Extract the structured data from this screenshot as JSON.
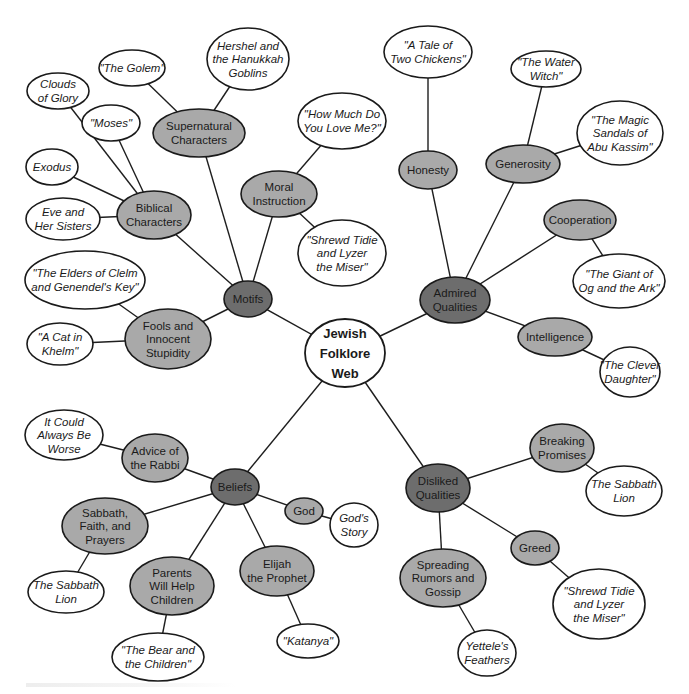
{
  "colors": {
    "background": "#ffffff",
    "root_fill": "#ffffff",
    "category_fill": "#6d6d6d",
    "subtopic_fill": "#a9a9a9",
    "story_fill": "#ffffff",
    "stroke": "#1a1a1a"
  },
  "nodes": [
    {
      "id": "root",
      "type": "root",
      "lines": [
        "Jewish",
        "Folklore",
        "Web"
      ],
      "cx": 345,
      "cy": 353,
      "rx": 40,
      "ry": 34
    },
    {
      "id": "motifs",
      "type": "cat",
      "lines": [
        "Motifs"
      ],
      "cx": 248,
      "cy": 299,
      "rx": 24,
      "ry": 18
    },
    {
      "id": "admired",
      "type": "cat",
      "lines": [
        "Admired",
        "Qualities"
      ],
      "cx": 455,
      "cy": 300,
      "rx": 35,
      "ry": 23
    },
    {
      "id": "beliefs",
      "type": "cat",
      "lines": [
        "Beliefs"
      ],
      "cx": 235,
      "cy": 487,
      "rx": 24,
      "ry": 18
    },
    {
      "id": "disliked",
      "type": "cat",
      "lines": [
        "Disliked",
        "Qualities"
      ],
      "cx": 438,
      "cy": 488,
      "rx": 32,
      "ry": 24
    },
    {
      "id": "supernatural",
      "type": "sub",
      "lines": [
        "Supernatural",
        "Characters"
      ],
      "cx": 199,
      "cy": 133,
      "rx": 46,
      "ry": 24
    },
    {
      "id": "hershel",
      "type": "leaf",
      "lines": [
        "Hershel and",
        "the Hanukkah",
        "Goblins"
      ],
      "cx": 248,
      "cy": 59,
      "rx": 41,
      "ry": 31
    },
    {
      "id": "golem",
      "type": "leaf",
      "lines": [
        "\"The Golem\""
      ],
      "cx": 132,
      "cy": 68,
      "rx": 33,
      "ry": 18
    },
    {
      "id": "biblical",
      "type": "sub",
      "lines": [
        "Biblical",
        "Characters"
      ],
      "cx": 154,
      "cy": 215,
      "rx": 37,
      "ry": 24
    },
    {
      "id": "clouds",
      "type": "leaf",
      "lines": [
        "Clouds",
        "of Glory"
      ],
      "cx": 58,
      "cy": 91,
      "rx": 31,
      "ry": 18
    },
    {
      "id": "moses",
      "type": "leaf",
      "lines": [
        "\"Moses\""
      ],
      "cx": 111,
      "cy": 123,
      "rx": 29,
      "ry": 18
    },
    {
      "id": "exodus",
      "type": "leaf",
      "lines": [
        "Exodus"
      ],
      "cx": 52,
      "cy": 167,
      "rx": 26,
      "ry": 18
    },
    {
      "id": "eve",
      "type": "leaf",
      "lines": [
        "Eve and",
        "Her Sisters"
      ],
      "cx": 63,
      "cy": 219,
      "rx": 37,
      "ry": 21
    },
    {
      "id": "moral",
      "type": "sub",
      "lines": [
        "Moral",
        "Instruction"
      ],
      "cx": 279,
      "cy": 194,
      "rx": 38,
      "ry": 23
    },
    {
      "id": "howmuch",
      "type": "leaf",
      "lines": [
        "\"How Much Do",
        "You Love Me?\""
      ],
      "cx": 342,
      "cy": 121,
      "rx": 44,
      "ry": 28
    },
    {
      "id": "shrewd1",
      "type": "leaf",
      "lines": [
        "\"Shrewd Tidie",
        "and Lyzer",
        "the Miser\""
      ],
      "cx": 342,
      "cy": 253,
      "rx": 44,
      "ry": 33
    },
    {
      "id": "fools",
      "type": "sub",
      "lines": [
        "Fools and",
        "Innocent",
        "Stupidity"
      ],
      "cx": 168,
      "cy": 339,
      "rx": 43,
      "ry": 30
    },
    {
      "id": "elders",
      "type": "leaf",
      "lines": [
        "\"The Elders of Clelm",
        "and Genendel's Key\""
      ],
      "cx": 85,
      "cy": 280,
      "rx": 60,
      "ry": 29
    },
    {
      "id": "cat",
      "type": "leaf",
      "lines": [
        "\"A Cat in",
        "Khelm\""
      ],
      "cx": 60,
      "cy": 344,
      "rx": 33,
      "ry": 21
    },
    {
      "id": "honesty",
      "type": "sub",
      "lines": [
        "Honesty"
      ],
      "cx": 428,
      "cy": 170,
      "rx": 29,
      "ry": 19
    },
    {
      "id": "chickens",
      "type": "leaf",
      "lines": [
        "\"A Tale of",
        "Two Chickens\""
      ],
      "cx": 428,
      "cy": 52,
      "rx": 44,
      "ry": 26
    },
    {
      "id": "generosity",
      "type": "sub",
      "lines": [
        "Generosity"
      ],
      "cx": 523,
      "cy": 164,
      "rx": 37,
      "ry": 19
    },
    {
      "id": "waterwitch",
      "type": "leaf",
      "lines": [
        "\"The Water",
        "Witch\""
      ],
      "cx": 546,
      "cy": 69,
      "rx": 35,
      "ry": 18
    },
    {
      "id": "sandals",
      "type": "leaf",
      "lines": [
        "\"The Magic",
        "Sandals of",
        "Abu Kassim\""
      ],
      "cx": 620,
      "cy": 133,
      "rx": 43,
      "ry": 32
    },
    {
      "id": "cooperation",
      "type": "sub",
      "lines": [
        "Cooperation"
      ],
      "cx": 580,
      "cy": 220,
      "rx": 36,
      "ry": 20
    },
    {
      "id": "giant",
      "type": "leaf",
      "lines": [
        "\"The Giant of",
        "Og and the Ark\""
      ],
      "cx": 619,
      "cy": 281,
      "rx": 46,
      "ry": 27
    },
    {
      "id": "intelligence",
      "type": "sub",
      "lines": [
        "Intelligence"
      ],
      "cx": 555,
      "cy": 337,
      "rx": 37,
      "ry": 19
    },
    {
      "id": "clever",
      "type": "leaf",
      "lines": [
        "\"The Clever",
        "Daughter\""
      ],
      "cx": 630,
      "cy": 372,
      "rx": 30,
      "ry": 25
    },
    {
      "id": "rabbi",
      "type": "sub",
      "lines": [
        "Advice of",
        "the Rabbi"
      ],
      "cx": 155,
      "cy": 458,
      "rx": 33,
      "ry": 24
    },
    {
      "id": "worse",
      "type": "leaf",
      "lines": [
        "It Could",
        "Always Be",
        "Worse"
      ],
      "cx": 64,
      "cy": 435,
      "rx": 39,
      "ry": 25
    },
    {
      "id": "god",
      "type": "sub",
      "lines": [
        "God"
      ],
      "cx": 304,
      "cy": 511,
      "rx": 19,
      "ry": 13
    },
    {
      "id": "godstory",
      "type": "leaf",
      "lines": [
        "God's",
        "Story"
      ],
      "cx": 354,
      "cy": 525,
      "rx": 24,
      "ry": 22
    },
    {
      "id": "sabbath",
      "type": "sub",
      "lines": [
        "Sabbath,",
        "Faith, and",
        "Prayers"
      ],
      "cx": 105,
      "cy": 526,
      "rx": 43,
      "ry": 28
    },
    {
      "id": "lion1",
      "type": "leaf",
      "lines": [
        "The Sabbath",
        "Lion"
      ],
      "cx": 66,
      "cy": 592,
      "rx": 38,
      "ry": 21
    },
    {
      "id": "parents",
      "type": "sub",
      "lines": [
        "Parents",
        "Will Help",
        "Children"
      ],
      "cx": 172,
      "cy": 586,
      "rx": 42,
      "ry": 29
    },
    {
      "id": "bear",
      "type": "leaf",
      "lines": [
        "\"The Bear and",
        "the Children\""
      ],
      "cx": 158,
      "cy": 657,
      "rx": 46,
      "ry": 24
    },
    {
      "id": "elijah",
      "type": "sub",
      "lines": [
        "Elijah",
        "the Prophet"
      ],
      "cx": 277,
      "cy": 571,
      "rx": 37,
      "ry": 25
    },
    {
      "id": "katanya",
      "type": "leaf",
      "lines": [
        "\"Katanya\""
      ],
      "cx": 308,
      "cy": 641,
      "rx": 31,
      "ry": 17
    },
    {
      "id": "promises",
      "type": "sub",
      "lines": [
        "Breaking",
        "Promises"
      ],
      "cx": 562,
      "cy": 448,
      "rx": 32,
      "ry": 24
    },
    {
      "id": "lion2",
      "type": "leaf",
      "lines": [
        "The Sabbath",
        "Lion"
      ],
      "cx": 624,
      "cy": 491,
      "rx": 38,
      "ry": 25
    },
    {
      "id": "greed",
      "type": "sub",
      "lines": [
        "Greed"
      ],
      "cx": 535,
      "cy": 548,
      "rx": 24,
      "ry": 17
    },
    {
      "id": "shrewd2",
      "type": "leaf",
      "lines": [
        "\"Shrewd Tidie",
        "and Lyzer",
        "the Miser\""
      ],
      "cx": 599,
      "cy": 604,
      "rx": 46,
      "ry": 35
    },
    {
      "id": "rumors",
      "type": "sub",
      "lines": [
        "Spreading",
        "Rumors and",
        "Gossip"
      ],
      "cx": 443,
      "cy": 578,
      "rx": 43,
      "ry": 29
    },
    {
      "id": "yettele",
      "type": "leaf",
      "lines": [
        "Yettele's",
        "Feathers"
      ],
      "cx": 487,
      "cy": 653,
      "rx": 29,
      "ry": 23
    }
  ],
  "edges": [
    [
      "root",
      "motifs"
    ],
    [
      "root",
      "admired"
    ],
    [
      "root",
      "beliefs"
    ],
    [
      "root",
      "disliked"
    ],
    [
      "motifs",
      "supernatural"
    ],
    [
      "motifs",
      "biblical"
    ],
    [
      "motifs",
      "moral"
    ],
    [
      "motifs",
      "fools"
    ],
    [
      "supernatural",
      "hershel"
    ],
    [
      "supernatural",
      "golem"
    ],
    [
      "biblical",
      "clouds"
    ],
    [
      "biblical",
      "moses"
    ],
    [
      "biblical",
      "exodus"
    ],
    [
      "biblical",
      "eve"
    ],
    [
      "moral",
      "howmuch"
    ],
    [
      "moral",
      "shrewd1"
    ],
    [
      "fools",
      "elders"
    ],
    [
      "fools",
      "cat"
    ],
    [
      "admired",
      "honesty"
    ],
    [
      "admired",
      "generosity"
    ],
    [
      "admired",
      "cooperation"
    ],
    [
      "admired",
      "intelligence"
    ],
    [
      "honesty",
      "chickens"
    ],
    [
      "generosity",
      "waterwitch"
    ],
    [
      "generosity",
      "sandals"
    ],
    [
      "cooperation",
      "giant"
    ],
    [
      "intelligence",
      "clever"
    ],
    [
      "beliefs",
      "rabbi"
    ],
    [
      "beliefs",
      "god"
    ],
    [
      "beliefs",
      "sabbath"
    ],
    [
      "beliefs",
      "parents"
    ],
    [
      "beliefs",
      "elijah"
    ],
    [
      "rabbi",
      "worse"
    ],
    [
      "god",
      "godstory"
    ],
    [
      "sabbath",
      "lion1"
    ],
    [
      "parents",
      "bear"
    ],
    [
      "elijah",
      "katanya"
    ],
    [
      "disliked",
      "promises"
    ],
    [
      "disliked",
      "greed"
    ],
    [
      "disliked",
      "rumors"
    ],
    [
      "promises",
      "lion2"
    ],
    [
      "greed",
      "shrewd2"
    ],
    [
      "rumors",
      "yettele"
    ]
  ]
}
